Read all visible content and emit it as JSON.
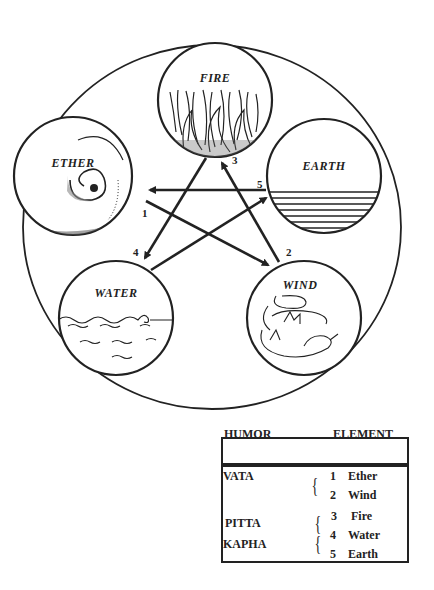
{
  "diagram": {
    "elements": [
      {
        "id": "fire",
        "label": "FIRE"
      },
      {
        "id": "ether",
        "label": "ETHER"
      },
      {
        "id": "earth",
        "label": "EARTH"
      },
      {
        "id": "water",
        "label": "WATER"
      },
      {
        "id": "wind",
        "label": "WIND"
      }
    ],
    "arrow_numbers": [
      "1",
      "2",
      "3",
      "4",
      "5"
    ],
    "arrows": [
      {
        "from": "ether",
        "to": "wind",
        "number": "1"
      },
      {
        "from": "wind",
        "to": "fire",
        "number": "2"
      },
      {
        "from": "fire",
        "to": "water",
        "number": "3"
      },
      {
        "from": "water",
        "to": "earth",
        "number": "4"
      },
      {
        "from": "earth",
        "to": "ether",
        "number": "5"
      }
    ]
  },
  "legend": {
    "headers": {
      "humor": "HUMOR",
      "element": "ELEMENT"
    },
    "rows": [
      {
        "humor": "VATA",
        "elements": [
          {
            "num": "1",
            "name": "Ether"
          },
          {
            "num": "2",
            "name": "Wind"
          }
        ]
      },
      {
        "humor": "PITTA",
        "elements": [
          {
            "num": "3",
            "name": "Fire"
          }
        ]
      },
      {
        "humor": "KAPHA",
        "elements": [
          {
            "num": "4",
            "name": "Water"
          },
          {
            "num": "5",
            "name": "Earth"
          }
        ]
      }
    ],
    "brace": "{"
  },
  "colors": {
    "ink": "#222222",
    "background": "#ffffff"
  }
}
